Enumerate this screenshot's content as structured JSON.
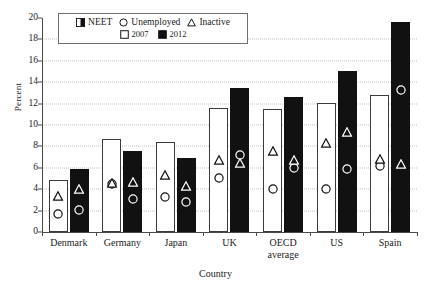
{
  "chart_data": {
    "type": "bar",
    "title": "",
    "xlabel": "Country",
    "ylabel": "Percent",
    "ylim": [
      0,
      20
    ],
    "ytick_step": 2,
    "yticks": [
      "20",
      "18",
      "16",
      "14",
      "12",
      "10",
      "8",
      "6",
      "4",
      "2",
      "0"
    ],
    "grid": true,
    "legend_position": "top-left-inside",
    "categories": [
      "Denmark",
      "Germany",
      "Japan",
      "UK",
      "OECD average",
      "Spain",
      "US"
    ],
    "category_labels": [
      {
        "line1": "Denmark",
        "line2": ""
      },
      {
        "line1": "Germany",
        "line2": ""
      },
      {
        "line1": "Japan",
        "line2": ""
      },
      {
        "line1": "UK",
        "line2": ""
      },
      {
        "line1": "OECD",
        "line2": "average"
      },
      {
        "line1": "US",
        "line2": ""
      },
      {
        "line1": "Spain",
        "line2": ""
      }
    ],
    "series": [
      {
        "name": "NEET 2007",
        "year": "2007",
        "measure": "NEET",
        "style": "open-bar",
        "values": [
          4.9,
          8.7,
          8.45,
          11.6,
          11.5,
          12.1,
          12.8
        ]
      },
      {
        "name": "NEET 2012",
        "year": "2012",
        "measure": "NEET",
        "style": "filled-bar",
        "values": [
          5.9,
          7.6,
          6.95,
          13.45,
          12.65,
          15.05,
          19.6
        ]
      },
      {
        "name": "Unemployed 2007",
        "year": "2007",
        "measure": "Unemployed",
        "style": "circle",
        "values": [
          1.6,
          4.35,
          3.2,
          4.95,
          3.95,
          3.9,
          6.05
        ]
      },
      {
        "name": "Unemployed 2012",
        "year": "2012",
        "measure": "Unemployed",
        "style": "circle",
        "values": [
          2.0,
          2.95,
          2.75,
          7.1,
          5.85,
          5.8,
          13.2
        ]
      },
      {
        "name": "Inactive 2007",
        "year": "2007",
        "measure": "Inactive",
        "style": "triangle",
        "values": [
          3.3,
          4.45,
          5.25,
          6.65,
          7.5,
          8.2,
          6.7
        ]
      },
      {
        "name": "Inactive 2012",
        "year": "2012",
        "measure": "Inactive",
        "style": "triangle",
        "values": [
          3.95,
          4.6,
          4.2,
          6.35,
          6.65,
          9.25,
          6.3
        ]
      }
    ],
    "legend": {
      "row1": [
        {
          "symbol": "half-filled-square",
          "label": "NEET"
        },
        {
          "symbol": "circle",
          "label": "Unemployed"
        },
        {
          "symbol": "triangle",
          "label": "Inactive"
        }
      ],
      "row2": [
        {
          "symbol": "open-square",
          "label": "2007"
        },
        {
          "symbol": "filled-square",
          "label": "2012"
        }
      ]
    },
    "colors": {
      "bar_2007_fill": "#ffffff",
      "bar_2007_stroke": "#3a3a3a",
      "bar_2012_fill": "#111111",
      "axis": "#4a4a4a",
      "gridline": "#c2c2c2",
      "background": "#ffffff"
    }
  }
}
